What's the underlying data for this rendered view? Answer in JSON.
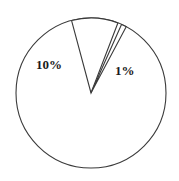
{
  "chart_data": {
    "type": "pie",
    "title": "",
    "subtitle": "",
    "xlabel": "",
    "ylabel": "",
    "grid": false,
    "legend_position": "none",
    "labels_shown_on_slices": true,
    "categories": [
      "10%",
      "1%",
      "rest"
    ],
    "values": [
      10,
      1,
      89
    ],
    "slices": [
      {
        "label": "10%",
        "value": 10,
        "unit": "percent",
        "start_angle_deg": 255,
        "end_angle_deg": 291,
        "fill_color": "#ffffff",
        "stroke_color": "#3a3a3a",
        "label_visible": true
      },
      {
        "label": "1%",
        "value": 1,
        "unit": "percent",
        "start_angle_deg": 294,
        "end_angle_deg": 298,
        "fill_color": "#ffffff",
        "stroke_color": "#3a3a3a",
        "label_visible": true
      },
      {
        "label": "rest",
        "value": 89,
        "unit": "percent",
        "start_angle_deg": 298,
        "end_angle_deg": 615,
        "fill_color": "#ffffff",
        "stroke_color": "#3a3a3a",
        "label_visible": false
      }
    ],
    "annotations": [
      {
        "text": "10%",
        "x": 52,
        "y": 65
      },
      {
        "text": "1%",
        "x": 126,
        "y": 71
      }
    ],
    "geometry": {
      "center_x": 91,
      "center_y": 93,
      "radius": 75
    },
    "colors": {
      "outline": "#3a3a3a",
      "fill": "#ffffff",
      "text": "#1a1a1a",
      "background": "#ffffff"
    }
  },
  "labels": {
    "ten_percent": "10%",
    "one_percent": "1%"
  }
}
